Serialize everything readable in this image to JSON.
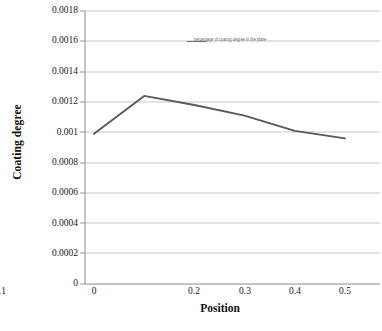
{
  "chart_data": {
    "type": "line",
    "title": "",
    "xlabel": "Position",
    "ylabel": "Coating degree",
    "x": [
      0,
      0.1,
      0.2,
      0.3,
      0.4,
      0.5
    ],
    "values": [
      0.00099,
      0.00124,
      0.00118,
      0.00111,
      0.00101,
      0.00096
    ],
    "series": [
      {
        "name": "percentage of coating degree in the plane",
        "values": [
          0.00099,
          0.00124,
          0.00118,
          0.00111,
          0.00101,
          0.00096
        ]
      }
    ],
    "xlim": [
      0,
      0.5
    ],
    "ylim": [
      0,
      0.0018
    ],
    "x_ticks": [
      "0",
      "0.1",
      "0.2",
      "0.3",
      "0.4",
      "0.5"
    ],
    "y_ticks": [
      "0",
      "0.0002",
      "0.0004",
      "0.0006",
      "0.0008",
      "0.001",
      "0.0012",
      "0.0014",
      "0.0016",
      "0.0018"
    ],
    "y_tick_values": [
      0,
      0.0002,
      0.0004,
      0.0006,
      0.0008,
      0.001,
      0.0012,
      0.0014,
      0.0016,
      0.0018
    ],
    "grid": true,
    "grid_axis": "y",
    "legend": {
      "position": "top-center-inside",
      "label": "percentage of coating degree in the plane"
    },
    "colors": {
      "line": "#595959",
      "grid": "#b9b9b9",
      "axis": "#6e6e6e",
      "text": "#1a1a1a",
      "background": "#ffffff"
    }
  },
  "axes": {
    "y_title": "Coating degree",
    "x_title": "Position"
  },
  "y_ticks": [
    {
      "label": "0.0018"
    },
    {
      "label": "0.0016"
    },
    {
      "label": "0.0014"
    },
    {
      "label": "0.0012"
    },
    {
      "label": "0.001"
    },
    {
      "label": "0.0008"
    },
    {
      "label": "0.0006"
    },
    {
      "label": "0.0004"
    },
    {
      "label": "0.0002"
    },
    {
      "label": "0"
    }
  ],
  "x_ticks": [
    {
      "label": "0"
    },
    {
      "label": "0.1"
    },
    {
      "label": "0.2"
    },
    {
      "label": "0.3"
    },
    {
      "label": "0.4"
    },
    {
      "label": "0.5"
    }
  ],
  "legend": {
    "label": "percentage of coating degree in the plane"
  }
}
